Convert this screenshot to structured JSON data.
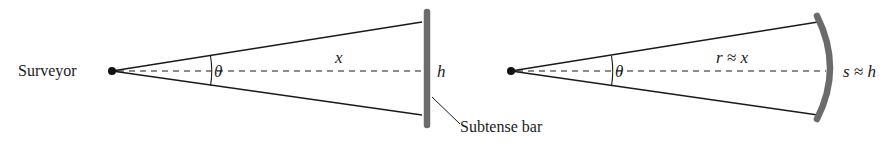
{
  "left_diagram": {
    "observer_label": "Surveyor",
    "angle_label": "θ",
    "distance_label": "x",
    "height_label": "h",
    "bar_callout": "Subtense bar"
  },
  "right_diagram": {
    "angle_label": "θ",
    "radius_label": "r ≈ x",
    "arc_label": "s ≈ h"
  },
  "colors": {
    "line": "#1a1a1a",
    "bar": "#6b6b6b",
    "background": "#ffffff"
  }
}
